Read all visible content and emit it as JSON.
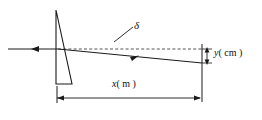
{
  "figure": {
    "kind": "optics-ray-diagram",
    "background_color": "#ffffff",
    "line_color": "#1a1a1a",
    "dashed_color": "#555555"
  },
  "labels": {
    "delta": "δ",
    "y_symbol": "y",
    "y_unit": "( cm )",
    "x_symbol": "x",
    "x_unit": "( m )"
  },
  "elements": {
    "incoming_ray_name": "incident-ray",
    "prism_name": "wedge-prism",
    "refracted_ray_name": "deviated-ray",
    "dashed_reference_name": "undeviated-axis",
    "angle_label_name": "deviation-angle-label",
    "y_dimension_name": "y-dimension",
    "x_dimension_name": "x-dimension"
  },
  "geometry": {
    "incident_ray": {
      "x1": 8,
      "y1": 49,
      "x2": 58,
      "y2": 49,
      "arrow_at": 36
    },
    "prism": {
      "apex_x": 56,
      "apex_y": 10,
      "bottom_left_x": 56,
      "bottom_left_y": 84,
      "bottom_right_x": 72,
      "bottom_right_y": 84
    },
    "dashed_axis": {
      "x1": 58,
      "y1": 49,
      "x2": 202,
      "y2": 49
    },
    "deviated_ray": {
      "x1": 58,
      "y1": 49,
      "x2": 202,
      "y2": 63,
      "arrow_at": 136
    },
    "delta_leader": {
      "x1": 114,
      "y1": 42,
      "x2": 133,
      "y2": 28
    },
    "y_dimension": {
      "x": 207,
      "y_top": 49,
      "y_bottom": 63
    },
    "x_dimension": {
      "y": 98,
      "x_left": 57,
      "x_right": 200
    },
    "right_vertical": {
      "x": 202,
      "y_top": 44,
      "y_bottom": 102
    },
    "left_vertical": {
      "x": 57,
      "y_top": 86,
      "y_bottom": 102
    }
  }
}
